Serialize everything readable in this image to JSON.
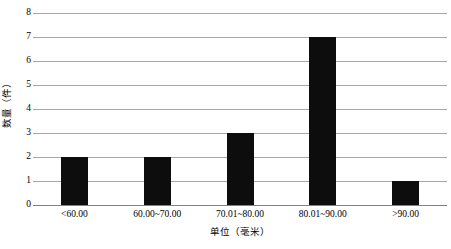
{
  "chart_data": {
    "type": "bar",
    "title": "",
    "categories": [
      "<60.00",
      "60.00~70.00",
      "70.01~80.00",
      "80.01~90.00",
      ">90.00"
    ],
    "values": [
      2,
      2,
      3,
      7,
      1
    ],
    "xlabel": "单位（毫米）",
    "ylabel": "数量（件）",
    "ylim": [
      0,
      8
    ],
    "yticks": [
      0,
      1,
      2,
      3,
      4,
      5,
      6,
      7,
      8
    ],
    "ytick_labels": [
      "0",
      "1",
      "2",
      "3",
      "4",
      "5",
      "6",
      "7",
      "8"
    ],
    "grid": "horizontal",
    "legend": "none",
    "bar_color": "#0d0d0d",
    "gridline_color": "#a6a6a6",
    "background_color": "#ffffff"
  }
}
